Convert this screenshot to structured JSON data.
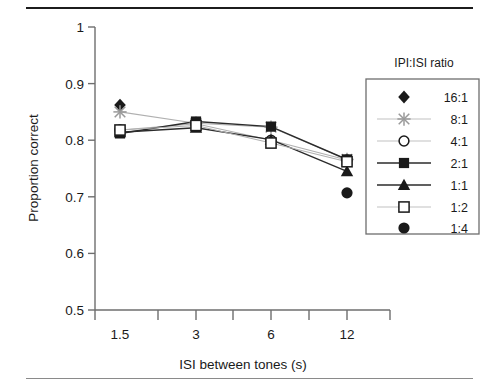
{
  "chart_data": {
    "type": "line",
    "title": "",
    "xlabel": "ISI between tones (s)",
    "ylabel": "Proportion correct",
    "categories": [
      "1.5",
      "3",
      "6",
      "12"
    ],
    "ylim": [
      0.5,
      1.0
    ],
    "yticks": [
      "0.5",
      "0.6",
      "0.7",
      "0.8",
      "0.9",
      "1"
    ],
    "ytick_values": [
      0.5,
      0.6,
      0.7,
      0.8,
      0.9,
      1.0
    ],
    "grid": false,
    "legend_title": "IPI:ISI ratio",
    "legend_position": "right",
    "series": [
      {
        "name": "16:1",
        "marker": "filled-diamond",
        "line": "none",
        "color": "#1a1a1a",
        "values": [
          0.862,
          null,
          null,
          null
        ]
      },
      {
        "name": "8:1",
        "marker": "x-cross",
        "line": "light",
        "color": "#9a9a9a",
        "values": [
          0.85,
          0.83,
          0.823,
          0.766
        ]
      },
      {
        "name": "4:1",
        "marker": "open-circle",
        "line": "light",
        "color": "#9a9a9a",
        "values": [
          0.818,
          0.829,
          0.8,
          0.765
        ]
      },
      {
        "name": "2:1",
        "marker": "filled-square",
        "line": "dark",
        "color": "#1a1a1a",
        "values": [
          0.812,
          0.833,
          0.824,
          0.766
        ]
      },
      {
        "name": "1:1",
        "marker": "filled-triangle",
        "line": "dark",
        "color": "#1a1a1a",
        "values": [
          0.814,
          0.822,
          0.801,
          0.745
        ]
      },
      {
        "name": "1:2",
        "marker": "open-square",
        "line": "light",
        "color": "#9a9a9a",
        "values": [
          0.818,
          0.826,
          0.795,
          0.762
        ]
      },
      {
        "name": "1:4",
        "marker": "filled-circle",
        "line": "none",
        "color": "#1a1a1a",
        "values": [
          null,
          null,
          null,
          0.707
        ]
      }
    ]
  },
  "axes": {
    "y_title": "Proportion correct",
    "x_title": "ISI between tones (s)",
    "y_labels": [
      "1",
      "0.9",
      "0.8",
      "0.7",
      "0.6",
      "0.5"
    ],
    "x_labels": [
      "1.5",
      "3",
      "6",
      "12"
    ]
  },
  "legend": {
    "title": "IPI:ISI ratio",
    "entries": [
      {
        "label": "16:1"
      },
      {
        "label": "8:1"
      },
      {
        "label": "4:1"
      },
      {
        "label": "2:1"
      },
      {
        "label": "1:1"
      },
      {
        "label": "1:2"
      },
      {
        "label": "1:4"
      }
    ]
  }
}
